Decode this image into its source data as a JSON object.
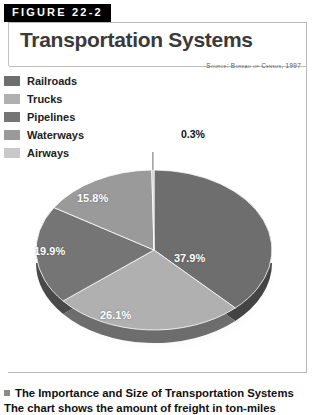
{
  "figure": {
    "badge": "FIGURE 22-2",
    "title": "Transportation Systems",
    "source": "Source: Bureau of Census, 1997"
  },
  "caption": {
    "headline": "The Importance and Size of Transportation Systems",
    "body": "The chart shows the amount of freight in ton-miles"
  },
  "colors": {
    "railroads": "#6e6e6e",
    "trucks": "#b0b0b0",
    "pipelines": "#757575",
    "waterways": "#9a9a9a",
    "airways": "#c9c9c9",
    "rim": "#4a4a4a",
    "badge_bg": "#000000",
    "title": "#3a3a3a",
    "label": "#ffffff"
  },
  "chart_data": {
    "type": "pie",
    "title": "Transportation Systems",
    "subtitle": "Source: Bureau of Census, 1997",
    "legend_position": "top-left",
    "start_angle_deg": 0,
    "direction": "clockwise",
    "three_d": true,
    "categories": [
      "Railroads",
      "Trucks",
      "Pipelines",
      "Waterways",
      "Airways"
    ],
    "values": [
      37.9,
      26.1,
      19.9,
      15.8,
      0.3
    ],
    "labels": [
      "37.9%",
      "26.1%",
      "19.9%",
      "15.8%",
      "0.3%"
    ],
    "units": "percent",
    "callouts": [
      {
        "label": "0.3%",
        "category": "Airways",
        "leader": true
      }
    ]
  },
  "legend": {
    "items": [
      {
        "label": "Railroads",
        "color": "#6e6e6e",
        "value": "37.9%"
      },
      {
        "label": "Trucks",
        "color": "#b0b0b0",
        "value": "26.1%"
      },
      {
        "label": "Pipelines",
        "color": "#757575",
        "value": "19.9%"
      },
      {
        "label": "Waterways",
        "color": "#9a9a9a",
        "value": "15.8%"
      },
      {
        "label": "Airways",
        "color": "#c9c9c9",
        "value": "0.3%"
      }
    ]
  },
  "slice_labels": {
    "railroads": "37.9%",
    "trucks": "26.1%",
    "pipelines": "19.9%",
    "waterways": "15.8%",
    "airways": "0.3%"
  }
}
